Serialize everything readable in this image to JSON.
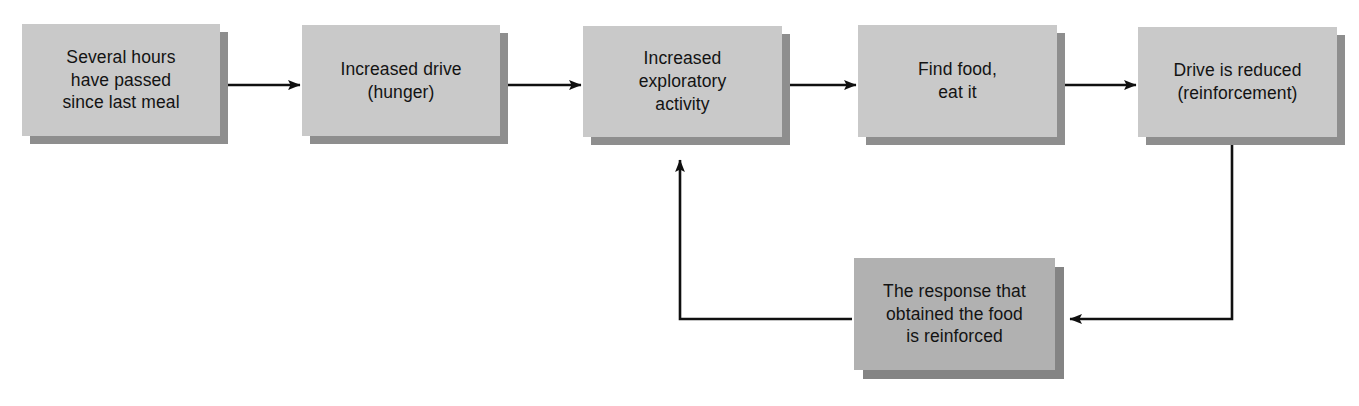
{
  "diagram": {
    "colors": {
      "node_fill_top": "#c9c9c9",
      "node_fill_bottom": "#b1b1b1",
      "node_shadow_top": "#8e8e8e",
      "node_shadow_bottom": "#848484",
      "arrow": "#101010",
      "background": "#ffffff",
      "text": "#131313"
    },
    "nodes": [
      {
        "id": "several-hours",
        "text": "Several hours\nhave passed\nsince last meal",
        "x": 22,
        "y": 24,
        "w": 198,
        "h": 112
      },
      {
        "id": "increased-drive",
        "text": "Increased drive\n(hunger)",
        "x": 302,
        "y": 25,
        "w": 198,
        "h": 111
      },
      {
        "id": "exploratory-activity",
        "text": "Increased\nexploratory\nactivity",
        "x": 583,
        "y": 26,
        "w": 199,
        "h": 111
      },
      {
        "id": "find-food",
        "text": "Find food,\neat it",
        "x": 858,
        "y": 25,
        "w": 199,
        "h": 112
      },
      {
        "id": "drive-reduced",
        "text": "Drive is reduced\n(reinforcement)",
        "x": 1138,
        "y": 27,
        "w": 199,
        "h": 110
      },
      {
        "id": "response-reinforced",
        "text": "The response that\nobtained the food\nis reinforced",
        "x": 854,
        "y": 258,
        "w": 201,
        "h": 112
      }
    ],
    "connectors": [
      {
        "id": "arrow-hours-to-drive",
        "label": "Several hours to Increased drive"
      },
      {
        "id": "arrow-drive-to-exploratory",
        "label": "Increased drive to Increased exploratory activity"
      },
      {
        "id": "arrow-exploratory-to-food",
        "label": "Increased exploratory activity to Find food"
      },
      {
        "id": "arrow-food-to-reduced",
        "label": "Find food to Drive is reduced"
      },
      {
        "id": "arrow-reduced-to-response",
        "label": "Drive is reduced down to The response that obtained the food is reinforced"
      },
      {
        "id": "arrow-response-to-exploratory",
        "label": "The response is reinforced back up to Increased exploratory activity"
      }
    ]
  }
}
